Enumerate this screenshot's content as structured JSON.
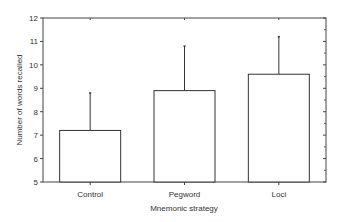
{
  "chart_data": {
    "type": "bar",
    "title": "",
    "xlabel": "Mnemonic strategy",
    "ylabel": "Number of words recalled",
    "categories": [
      "Control",
      "Pegword",
      "Loci"
    ],
    "values": [
      7.2,
      8.9,
      9.6
    ],
    "error_upper": [
      8.8,
      10.8,
      11.2
    ],
    "ylim": [
      5,
      12
    ],
    "yticks": [
      5,
      6,
      7,
      8,
      9,
      10,
      11,
      12
    ],
    "grid": false,
    "legend": null
  },
  "style": {
    "bar_fill": "#ffffff",
    "bar_stroke": "#333333",
    "axis_color": "#444444"
  }
}
